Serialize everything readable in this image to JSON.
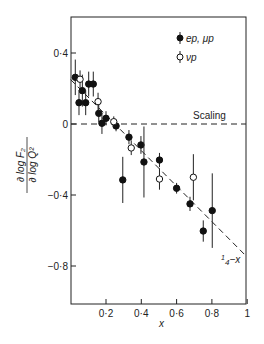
{
  "chart_data": {
    "type": "scatter",
    "title": "",
    "xlabel": "x",
    "ylabel_numerator": "∂ log F₂",
    "ylabel_denominator": "∂ log Q²",
    "xlim": [
      0,
      1
    ],
    "ylim": [
      -1.0,
      0.6
    ],
    "x_ticks": [
      {
        "value": 0.2,
        "label": "0·2"
      },
      {
        "value": 0.4,
        "label": "0·4"
      },
      {
        "value": 0.6,
        "label": "0·6"
      },
      {
        "value": 0.8,
        "label": "0·8"
      },
      {
        "value": 1.0,
        "label": "1"
      }
    ],
    "y_ticks": [
      {
        "value": 0.4,
        "label": "0·4"
      },
      {
        "value": 0.0,
        "label": "0"
      },
      {
        "value": -0.4,
        "label": "−0·4"
      },
      {
        "value": -0.8,
        "label": "−0·8"
      }
    ],
    "grid": false,
    "legend_position": "top-right",
    "series": [
      {
        "name": "ep, μp",
        "marker": "filled-circle",
        "points": [
          {
            "x": 0.026,
            "y": 0.263,
            "err": 0.1
          },
          {
            "x": 0.066,
            "y": 0.188,
            "err": 0.09
          },
          {
            "x": 0.047,
            "y": 0.12,
            "err": 0.07
          },
          {
            "x": 0.085,
            "y": 0.12,
            "err": 0.07
          },
          {
            "x": 0.102,
            "y": 0.225,
            "err": 0.07
          },
          {
            "x": 0.128,
            "y": 0.225,
            "err": 0.07
          },
          {
            "x": 0.159,
            "y": 0.06,
            "err": 0.05
          },
          {
            "x": 0.177,
            "y": 0.004,
            "err": 0.06
          },
          {
            "x": 0.2,
            "y": 0.032,
            "err": 0.04
          },
          {
            "x": 0.257,
            "y": -0.011,
            "err": 0.03
          },
          {
            "x": 0.33,
            "y": -0.074,
            "err": 0.04
          },
          {
            "x": 0.295,
            "y": -0.315,
            "err": 0.13
          },
          {
            "x": 0.398,
            "y": -0.118,
            "err": 0.05
          },
          {
            "x": 0.415,
            "y": -0.214,
            "err": 0.2
          },
          {
            "x": 0.503,
            "y": -0.203,
            "err": 0.04
          },
          {
            "x": 0.6,
            "y": -0.362,
            "err": 0.03
          },
          {
            "x": 0.676,
            "y": -0.45,
            "err": 0.04
          },
          {
            "x": 0.751,
            "y": -0.603,
            "err": 0.06
          },
          {
            "x": 0.802,
            "y": -0.488,
            "err": 0.21
          }
        ]
      },
      {
        "name": "νp",
        "marker": "open-circle",
        "points": [
          {
            "x": 0.053,
            "y": 0.252,
            "err": 0.05
          },
          {
            "x": 0.155,
            "y": 0.126,
            "err": 0.05
          },
          {
            "x": 0.244,
            "y": 0.013,
            "err": 0.03
          },
          {
            "x": 0.343,
            "y": -0.135,
            "err": 0.04
          },
          {
            "x": 0.503,
            "y": -0.31,
            "err": 0.06
          },
          {
            "x": 0.695,
            "y": -0.3,
            "err": 0.13
          }
        ]
      }
    ],
    "reference_lines": [
      {
        "name": "scaling",
        "label": "Scaling",
        "type": "horizontal",
        "y": 0.0
      },
      {
        "name": "quarter-minus-x",
        "label_pre": "1",
        "label_den": "4",
        "label_post": "−x",
        "type": "line",
        "slope": -1.0,
        "intercept": 0.25,
        "x_range": [
          0.0,
          0.99
        ]
      }
    ]
  }
}
